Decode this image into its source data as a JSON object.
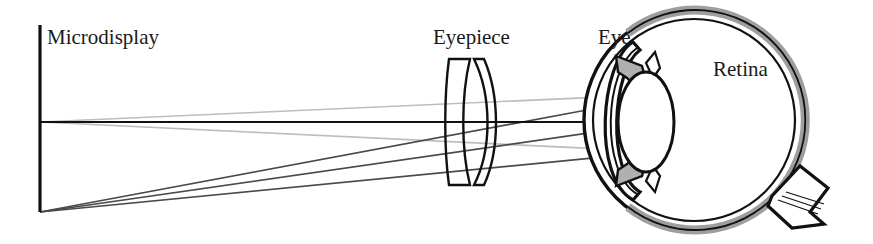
{
  "figure": {
    "width": 873,
    "height": 244,
    "background_color": "#ffffff"
  },
  "labels": {
    "microdisplay": "Microdisplay",
    "eyepiece": "Eyepiece",
    "eye": "Eye",
    "retina": "Retina"
  },
  "colors": {
    "ink": "#111111",
    "ray_dark": "#4a4a4a",
    "ray_light": "#bdbdbd",
    "retina_fill": "#9e9e9e",
    "iris_fill": "#b0b0b0",
    "background": "#ffffff"
  },
  "components": {
    "microdisplay": {
      "name": "microdisplay",
      "type": "flat-emissive-panel",
      "x": 40,
      "y_top": 25,
      "y_bottom": 212
    },
    "optical_axis": {
      "name": "optical-axis",
      "y": 122,
      "x_start": 40,
      "x_end": 806
    },
    "eyepiece": {
      "name": "eyepiece-doublet",
      "type": "cemented-meniscus-doublet",
      "element_count": 2,
      "x_left": 448,
      "x_right": 492,
      "y_top": 58,
      "y_bottom": 186
    },
    "eye": {
      "name": "human-eye",
      "globe_center_x": 694,
      "globe_center_y": 120,
      "globe_radius": 112,
      "parts": [
        "cornea",
        "anterior-chamber",
        "iris",
        "crystalline-lens",
        "vitreous-chamber",
        "retina",
        "sclera",
        "optic-nerve"
      ]
    },
    "crystalline_lens": {
      "name": "crystalline-lens",
      "center_x": 646,
      "center_y": 122,
      "semi_axis_x": 28,
      "semi_axis_y": 50
    },
    "optic_nerve": {
      "name": "optic-nerve",
      "exit_angle_deg": 40,
      "position": "inferior-temporal"
    }
  },
  "ray_bundles": [
    {
      "name": "on-axis-bundle",
      "shade": "light",
      "object_point_y": 122,
      "image_point_x": 800,
      "image_point_y": 127,
      "ray_count": 3
    },
    {
      "name": "off-axis-bundle",
      "shade": "dark",
      "object_point_y": 212,
      "image_point_x": 800,
      "image_point_y": 92,
      "ray_count": 3
    }
  ]
}
